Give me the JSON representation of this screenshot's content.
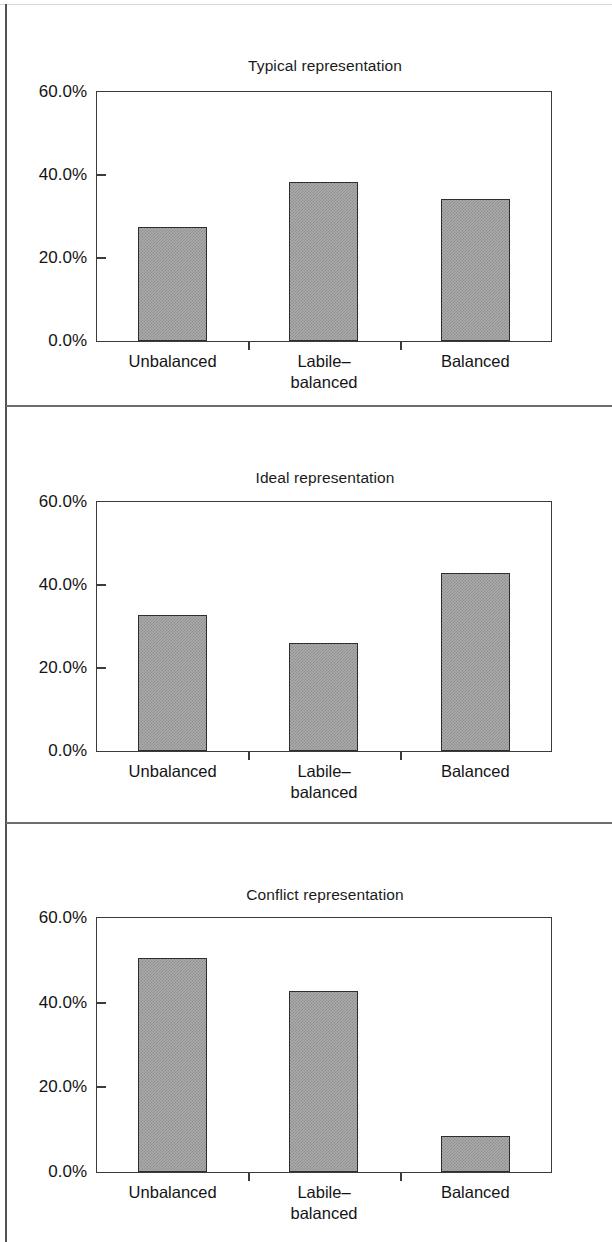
{
  "figure": {
    "axis": {
      "y_ticks": [
        "60.0%",
        "40.0%",
        "20.0%",
        "0.0%"
      ],
      "y_min": 0,
      "y_max": 60
    },
    "categories": [
      "Unbalanced",
      "Labile–\nbalanced",
      "Balanced"
    ]
  },
  "chart_data": [
    {
      "type": "bar",
      "title": "Typical representation",
      "categories": [
        "Unbalanced",
        "Labile–balanced",
        "Balanced"
      ],
      "values": [
        27.5,
        38.3,
        34.2
      ],
      "xlabel": "",
      "ylabel": "",
      "ylim": [
        0,
        60
      ],
      "ytick_labels": [
        "0.0%",
        "20.0%",
        "40.0%",
        "60.0%"
      ],
      "grid": false,
      "legend": "none"
    },
    {
      "type": "bar",
      "title": "Ideal representation",
      "categories": [
        "Unbalanced",
        "Labile–balanced",
        "Balanced"
      ],
      "values": [
        32.8,
        26.1,
        43.0
      ],
      "xlabel": "",
      "ylabel": "",
      "ylim": [
        0,
        60
      ],
      "ytick_labels": [
        "0.0%",
        "20.0%",
        "40.0%",
        "60.0%"
      ],
      "grid": false,
      "legend": "none"
    },
    {
      "type": "bar",
      "title": "Conflict representation",
      "categories": [
        "Unbalanced",
        "Labile–balanced",
        "Balanced"
      ],
      "values": [
        50.5,
        42.7,
        8.5
      ],
      "xlabel": "",
      "ylabel": "",
      "ylim": [
        0,
        60
      ],
      "ytick_labels": [
        "0.0%",
        "20.0%",
        "40.0%",
        "60.0%"
      ],
      "grid": false,
      "legend": "none"
    }
  ],
  "panels": [
    {
      "title": "Typical representation",
      "ylabels": [
        "60.0%",
        "40.0%",
        "20.0%",
        "0.0%"
      ],
      "bars": [
        {
          "label": "Unbalanced",
          "value": 27.5
        },
        {
          "label": "Labile–\nbalanced",
          "value": 38.3
        },
        {
          "label": "Balanced",
          "value": 34.2
        }
      ]
    },
    {
      "title": "Ideal representation",
      "ylabels": [
        "60.0%",
        "40.0%",
        "20.0%",
        "0.0%"
      ],
      "bars": [
        {
          "label": "Unbalanced",
          "value": 32.8
        },
        {
          "label": "Labile–\nbalanced",
          "value": 26.1
        },
        {
          "label": "Balanced",
          "value": 43.0
        }
      ]
    },
    {
      "title": "Conflict representation",
      "ylabels": [
        "60.0%",
        "40.0%",
        "20.0%",
        "0.0%"
      ],
      "bars": [
        {
          "label": "Unbalanced",
          "value": 50.5
        },
        {
          "label": "Labile–\nbalanced",
          "value": 42.7
        },
        {
          "label": "Balanced",
          "value": 8.5
        }
      ]
    }
  ],
  "style": {
    "bar_fill": "#ababab",
    "bar_stroke": "#2e2e2e",
    "axis_color": "#3b3b3b",
    "text_color": "#141414"
  }
}
